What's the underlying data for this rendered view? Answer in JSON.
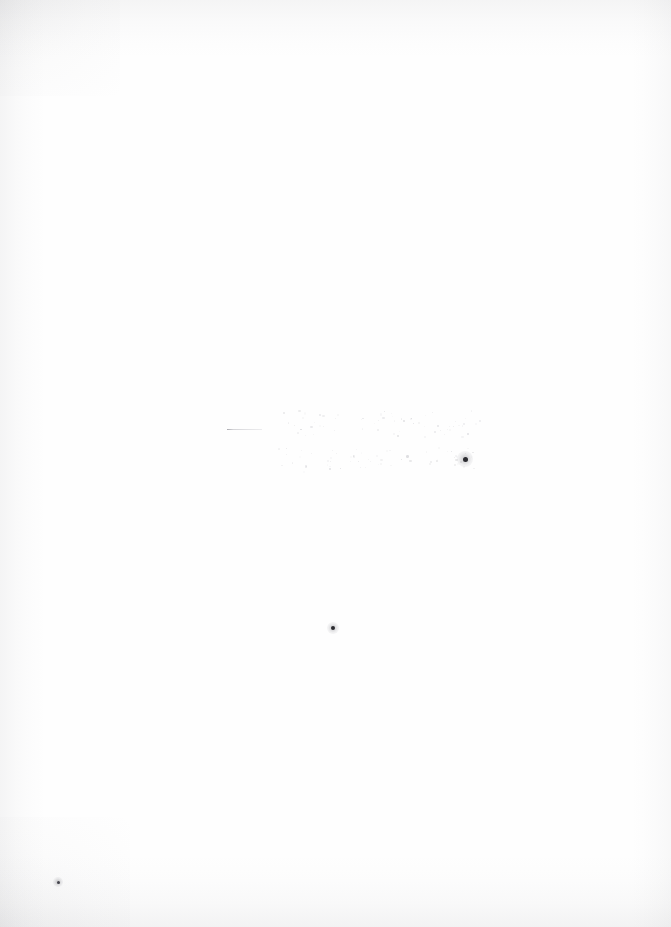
{
  "document": {
    "kind": "scanned-page",
    "description": "Near-blank scanned sheet of paper",
    "width": 671,
    "height": 927,
    "paper_color": "#fefefe",
    "background_color": "#ffffff",
    "text_content": "",
    "legible_text_present": false
  },
  "marks": {
    "rule": {
      "label": "short horizontal rule",
      "x": 227,
      "y": 429,
      "width": 35,
      "color": "#7c7c84"
    },
    "faint_rows": [
      {
        "label": "faint illegible marking row (upper)",
        "x": 281,
        "y": 410,
        "width": 199,
        "height": 26,
        "legible": false
      },
      {
        "label": "faint illegible marking row (lower)",
        "x": 276,
        "y": 447,
        "width": 200,
        "height": 24,
        "legible": false
      }
    ],
    "ink_dots": [
      {
        "label": "ink speck right of faint rows",
        "x": 465,
        "y": 459,
        "size": 5,
        "color": "#2b2b30"
      },
      {
        "label": "ink speck lower page",
        "x": 333,
        "y": 628,
        "size": 4,
        "color": "#2b2b30"
      },
      {
        "label": "ink speck lower left margin",
        "x": 58,
        "y": 882,
        "size": 3,
        "color": "#44444c"
      }
    ]
  },
  "scan_artifacts": {
    "vignette_color": "#8e8e93",
    "edges": [
      "top",
      "bottom",
      "left",
      "right"
    ]
  }
}
